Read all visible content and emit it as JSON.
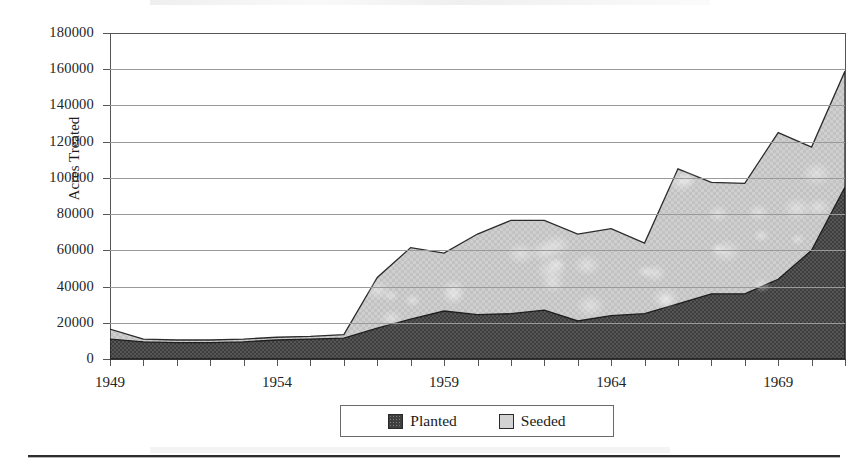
{
  "chart_data": {
    "type": "area",
    "stacked": true,
    "title": "",
    "xlabel": "",
    "ylabel": "Acres Treated",
    "x": [
      1949,
      1950,
      1951,
      1952,
      1953,
      1954,
      1955,
      1956,
      1957,
      1958,
      1959,
      1960,
      1961,
      1962,
      1963,
      1964,
      1965,
      1966,
      1967,
      1968,
      1969,
      1970,
      1971
    ],
    "xtick_labels": [
      "1949",
      "1954",
      "1959",
      "1964",
      "1969"
    ],
    "xtick_years": [
      1949,
      1954,
      1959,
      1964,
      1969
    ],
    "ylim": [
      0,
      180000
    ],
    "ytick_labels": [
      "0",
      "20000",
      "40000",
      "60000",
      "80000",
      "100000",
      "120000",
      "140000",
      "160000",
      "180000"
    ],
    "ytick_values": [
      0,
      20000,
      40000,
      60000,
      80000,
      100000,
      120000,
      140000,
      160000,
      180000
    ],
    "grid": true,
    "legend_position": "bottom",
    "series": [
      {
        "name": "Planted",
        "color": "#3f3f3f",
        "values": [
          11000,
          9500,
          9000,
          9000,
          9500,
          10500,
          11000,
          11500,
          17000,
          22000,
          26500,
          24500,
          25000,
          27000,
          21000,
          24000,
          25000,
          30500,
          36000,
          36000,
          44000,
          60000,
          95000
        ]
      },
      {
        "name": "Seeded",
        "color": "#d2d2d2",
        "values": [
          5500,
          1500,
          1500,
          1500,
          1500,
          1500,
          1500,
          2000,
          28000,
          39500,
          32000,
          44500,
          51500,
          49500,
          48000,
          48000,
          39000,
          74500,
          61500,
          61000,
          81000,
          57000,
          64000
        ]
      }
    ],
    "totals": [
      16500,
      11000,
      10500,
      10500,
      11000,
      12000,
      12500,
      13500,
      45000,
      61500,
      58500,
      69000,
      76500,
      76500,
      69000,
      72000,
      64000,
      105000,
      97500,
      97000,
      125000,
      117000,
      159000
    ]
  },
  "legend": {
    "items": [
      {
        "label": "Planted",
        "swatch": "planted-swatch"
      },
      {
        "label": "Seeded",
        "swatch": "seeded-swatch"
      }
    ]
  },
  "axis": {
    "y_title": "Acres Treated"
  }
}
